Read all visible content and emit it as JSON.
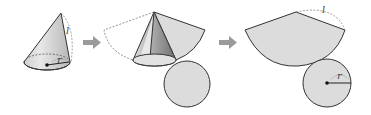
{
  "diagram": {
    "colors": {
      "fill": "#dcdcdc",
      "stroke": "#333333",
      "dashed": "#888888",
      "arrow": "#8c8c8c",
      "shade_dark": "#9a9a9a"
    },
    "stages": [
      {
        "id": "cone",
        "labels": {
          "slant": "l",
          "radius": "r"
        }
      },
      {
        "id": "unrolling"
      },
      {
        "id": "net",
        "labels": {
          "slant": "l",
          "radius": "r"
        }
      }
    ],
    "arrows": [
      {
        "from": "cone",
        "to": "unrolling"
      },
      {
        "from": "unrolling",
        "to": "net"
      }
    ]
  }
}
